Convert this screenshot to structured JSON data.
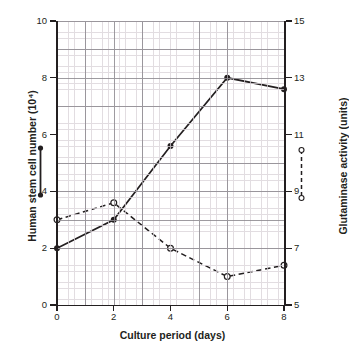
{
  "chart_data": {
    "type": "line",
    "title": "",
    "xlabel": "Culture period (days)",
    "x": [
      0,
      2,
      4,
      6,
      8
    ],
    "xlim": [
      0,
      8
    ],
    "xticks": [
      0,
      2,
      4,
      6,
      8
    ],
    "grid": true,
    "legend_position": "axis-labels",
    "axes": [
      {
        "side": "left",
        "ylabel": "Human stem cell number (10⁴)",
        "ylim": [
          0,
          10
        ],
        "yticks": [
          0,
          2,
          4,
          6,
          8,
          10
        ],
        "marker": "filled-circle",
        "line_style": "solid"
      },
      {
        "side": "right",
        "ylabel": "Glutaminase activity (units)",
        "ylim": [
          5,
          15
        ],
        "yticks": [
          5,
          7,
          9,
          11,
          13,
          15
        ],
        "marker": "open-circle",
        "line_style": "dashed"
      }
    ],
    "series": [
      {
        "name": "Human stem cell number (10⁴)",
        "axis": "left",
        "line_style": "solid",
        "marker": "filled-circle",
        "values": [
          2.0,
          3.0,
          5.6,
          8.0,
          7.6
        ]
      },
      {
        "name": "Glutaminase activity (units)",
        "axis": "right",
        "line_style": "dashed",
        "marker": "open-circle",
        "values": [
          8.0,
          8.6,
          7.0,
          6.0,
          6.4
        ]
      }
    ]
  },
  "axis_left": {
    "title": "Human stem cell number (10⁴)",
    "ticks": [
      "0",
      "2",
      "4",
      "6",
      "8",
      "10"
    ]
  },
  "axis_right": {
    "title": "Glutaminase activity (units)",
    "ticks": [
      "5",
      "7",
      "9",
      "11",
      "13",
      "15"
    ]
  },
  "axis_bottom": {
    "title": "Culture period (days)",
    "ticks": [
      "0",
      "2",
      "4",
      "6",
      "8"
    ]
  },
  "captions": {
    "top": "",
    "bottom": ""
  },
  "colors": {
    "ink": "#231f20",
    "grid_minor": "#d9d2d8",
    "grid_major": "#8e8a90",
    "background": "#ffffff"
  }
}
